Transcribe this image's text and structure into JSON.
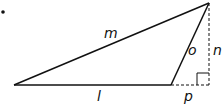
{
  "diagram": {
    "type": "triangle-with-altitude",
    "labels": {
      "m": "m",
      "o": "o",
      "n": "n",
      "l": "l",
      "p": "p"
    },
    "colors": {
      "stroke": "#111111",
      "background": "#ffffff"
    }
  }
}
